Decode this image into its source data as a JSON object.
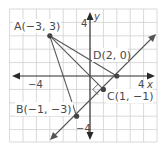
{
  "figure": {
    "title": "",
    "axes": {
      "x_label": "x",
      "y_label": "y",
      "x_tick_labels": [
        "−4",
        "4"
      ],
      "y_tick_labels": [
        "4",
        "−4"
      ]
    },
    "points": [
      {
        "name": "A",
        "label": "A(−3, 3)",
        "x": -3,
        "y": 3
      },
      {
        "name": "B",
        "label": "B(−1, −3)",
        "x": -1,
        "y": -3
      },
      {
        "name": "C",
        "label": "C(1, −1)",
        "x": 1,
        "y": -1
      },
      {
        "name": "D",
        "label": "D(2, 0)",
        "x": 2,
        "y": 0
      }
    ],
    "segments": [
      {
        "from": "A",
        "to": "B"
      },
      {
        "from": "A",
        "to": "C"
      },
      {
        "from": "A",
        "to": "D"
      }
    ],
    "line": {
      "description": "line y = x - 2 through B, C, D with arrows at both ends"
    },
    "right_angle_marker": {
      "at": "C",
      "between": [
        "AC",
        "line BD"
      ]
    },
    "colors": {
      "grid": "#c8c8c8",
      "axis": "#2a2a2a",
      "lines": "#555555",
      "points": "#444444",
      "text": "#4a4a4a"
    }
  }
}
